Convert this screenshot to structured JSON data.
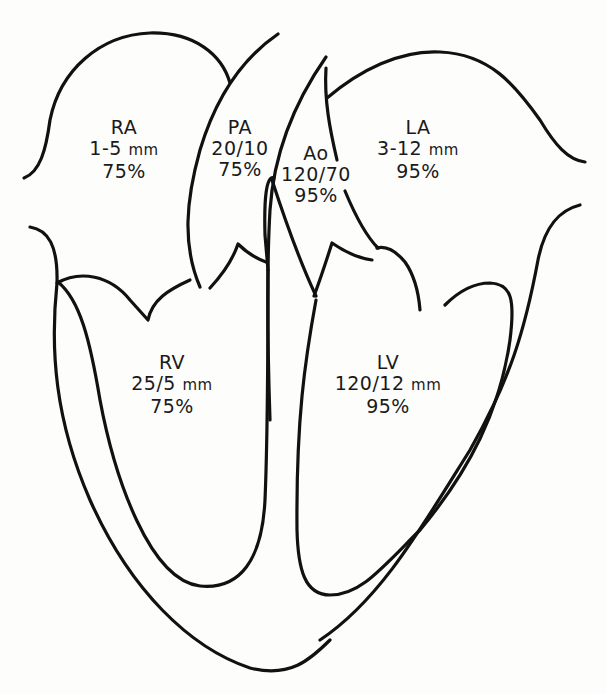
{
  "diagram": {
    "stroke_color": "#111111",
    "background_color": "#fdfdfc",
    "chambers": [
      {
        "id": "RA",
        "name": "RA",
        "pressure": "1-5",
        "unit": "mm",
        "saturation": "75%"
      },
      {
        "id": "PA",
        "name": "PA",
        "pressure": "20/10",
        "unit": "",
        "saturation": "75%"
      },
      {
        "id": "Ao",
        "name": "Ao",
        "pressure": "120/70",
        "unit": "",
        "saturation": "95%"
      },
      {
        "id": "LA",
        "name": "LA",
        "pressure": "3-12",
        "unit": "mm",
        "saturation": "95%"
      },
      {
        "id": "RV",
        "name": "RV",
        "pressure": "25/5",
        "unit": "mm",
        "saturation": "75%"
      },
      {
        "id": "LV",
        "name": "LV",
        "pressure": "120/12",
        "unit": "mm",
        "saturation": "95%"
      }
    ]
  }
}
